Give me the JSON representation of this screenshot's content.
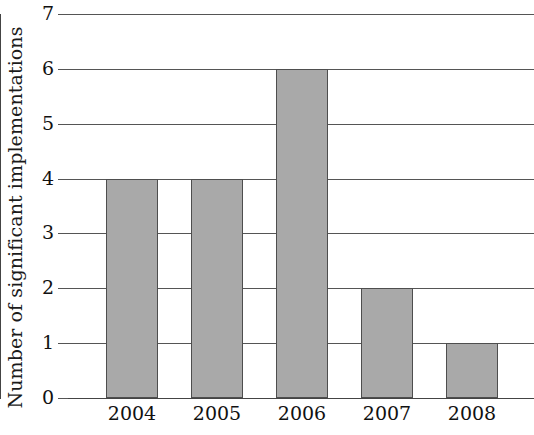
{
  "chart_data": {
    "type": "bar",
    "title": "",
    "subtitle": "",
    "xlabel": "",
    "ylabel": "Number of significant implementations",
    "categories": [
      "2004",
      "2005",
      "2006",
      "2007",
      "2008"
    ],
    "values": [
      4,
      4,
      6,
      2,
      1
    ],
    "ylim": [
      0,
      7
    ],
    "ytick_labels": [
      "0",
      "1",
      "2",
      "3",
      "4",
      "5",
      "6",
      "7"
    ],
    "ytick_values": [
      0,
      1,
      2,
      3,
      4,
      5,
      6,
      7
    ],
    "grid": true,
    "grid_axis": "y",
    "legend": null,
    "legend_position": "none",
    "bar_color": "#a9a9a9",
    "bar_edge_color": "#4e4e4e",
    "axis_color": "#444444",
    "gridline_color": "#555555",
    "background_color": "#ffffff",
    "text_color": "#111111",
    "annotations": []
  }
}
